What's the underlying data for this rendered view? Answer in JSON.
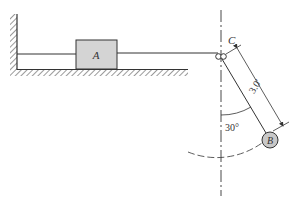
{
  "diagram": {
    "block_label": "A",
    "pulley_label": "C",
    "bob_label": "B",
    "length_label": "3.0′",
    "angle_label": "30°",
    "colors": {
      "ink": "#333333",
      "block_fill": "#d4d4d4",
      "bob_fill": "#c8c8c8"
    }
  }
}
